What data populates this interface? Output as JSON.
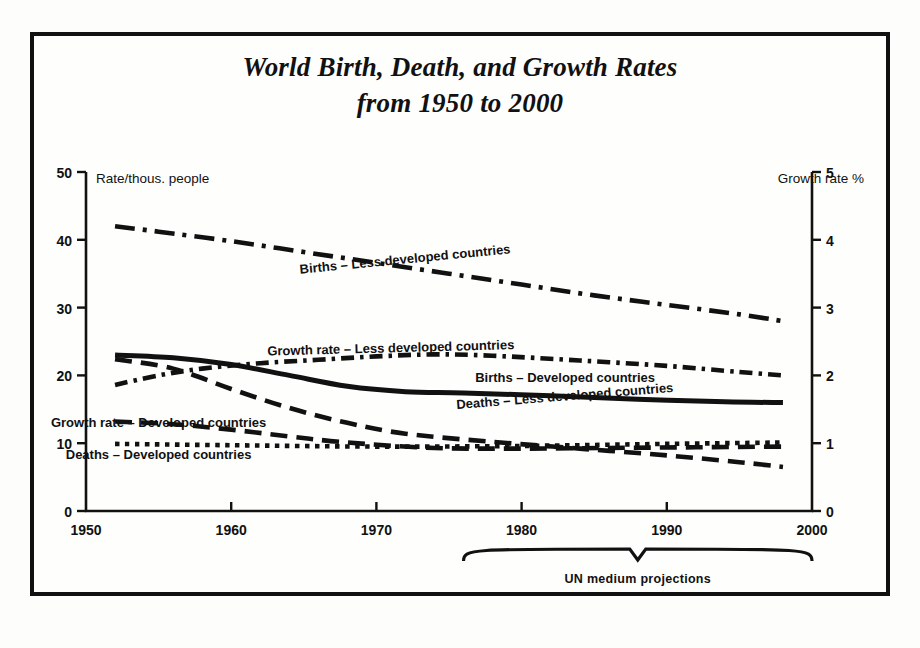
{
  "title": {
    "line1": "World Birth, Death, and Growth Rates",
    "line2": "from 1950 to 2000"
  },
  "axis_captions": {
    "left": "Rate/thous. people",
    "right": "Growth rate %"
  },
  "annotation": {
    "brace_label": "UN medium projections",
    "brace_start_year": 1976,
    "brace_end_year": 2000
  },
  "colors": {
    "ink": "#111111",
    "paper": "#fdfdfb"
  },
  "chart_data": {
    "type": "line",
    "title": "World Birth, Death, and Growth Rates from 1950 to 2000",
    "xlabel": "",
    "ylabel": "Rate/thous. people",
    "y2label": "Growth rate %",
    "xlim": [
      1950,
      2000
    ],
    "ylim": [
      0,
      50
    ],
    "y2lim": [
      0,
      5
    ],
    "grid": false,
    "legend": "inline-on-curve",
    "xticks": [
      1950,
      1960,
      1970,
      1980,
      1990,
      2000
    ],
    "yticks": [
      0,
      10,
      20,
      30,
      40,
      50
    ],
    "y2ticks": [
      0,
      1,
      2,
      3,
      4,
      5
    ],
    "series": [
      {
        "name": "Births – Less developed countries",
        "axis": "left",
        "style": "dash-dot",
        "label_position": {
          "year": 1972,
          "value": 36.5,
          "rotation": -5.5
        },
        "x": [
          1952,
          1955,
          1960,
          1965,
          1970,
          1975,
          1980,
          1985,
          1990,
          1995,
          1998
        ],
        "values": [
          42.0,
          41.2,
          39.8,
          38.2,
          36.6,
          35.0,
          33.4,
          31.8,
          30.4,
          29.0,
          28.0
        ]
      },
      {
        "name": "Growth rate – Less developed countries",
        "axis": "right",
        "style": "dash-dot-dense",
        "label_position": {
          "year": 1971,
          "value": 23.4,
          "rotation": -1.5
        },
        "x": [
          1952,
          1955,
          1958,
          1962,
          1966,
          1970,
          1974,
          1978,
          1984,
          1990,
          1995,
          1998
        ],
        "values": [
          18.6,
          20.0,
          21.0,
          21.8,
          22.3,
          22.8,
          23.1,
          22.9,
          22.2,
          21.4,
          20.5,
          20.0
        ]
      },
      {
        "name": "Births – Developed countries",
        "axis": "left",
        "style": "solid",
        "label_position": {
          "year": 1983,
          "value": 19.0,
          "rotation": 0
        },
        "x": [
          1952,
          1956,
          1960,
          1964,
          1968,
          1972,
          1976,
          1982,
          1988,
          1994,
          1998
        ],
        "values": [
          23.0,
          22.6,
          21.6,
          20.0,
          18.4,
          17.6,
          17.4,
          17.0,
          16.5,
          16.1,
          16.0
        ]
      },
      {
        "name": "Deaths – Less developed countries",
        "axis": "left",
        "style": "long-dash",
        "label_position": {
          "year": 1983,
          "value": 16.3,
          "rotation": -4.5
        },
        "x": [
          1952,
          1956,
          1960,
          1964,
          1968,
          1972,
          1978,
          1984,
          1990,
          1995,
          1998
        ],
        "values": [
          22.4,
          21.0,
          18.0,
          15.2,
          13.0,
          11.4,
          10.2,
          9.2,
          8.2,
          7.2,
          6.5
        ]
      },
      {
        "name": "Growth rate – Developed countries",
        "axis": "right",
        "style": "long-dash",
        "label_position": {
          "year": 1955,
          "value": 12.4,
          "rotation": 0
        },
        "x": [
          1952,
          1956,
          1960,
          1964,
          1968,
          1974,
          1980,
          1986,
          1992,
          1998
        ],
        "values": [
          13.2,
          12.8,
          12.0,
          11.0,
          10.1,
          9.3,
          9.2,
          9.3,
          9.4,
          9.5
        ]
      },
      {
        "name": "Deaths – Developed countries",
        "axis": "left",
        "style": "dotted",
        "label_position": {
          "year": 1955,
          "value": 7.6,
          "rotation": 0
        },
        "x": [
          1952,
          1960,
          1970,
          1980,
          1990,
          1998
        ],
        "values": [
          9.9,
          9.7,
          9.5,
          9.6,
          9.9,
          10.1
        ]
      }
    ]
  }
}
